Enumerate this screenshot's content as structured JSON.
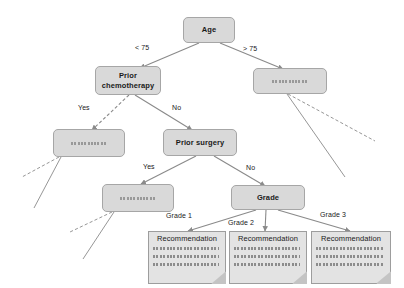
{
  "diagram": {
    "type": "decision-tree-flowchart",
    "colors": {
      "node_fill": "#d9d9d9",
      "node_border": "#a6a6a6",
      "doc_fill": "#e3e3e3",
      "doc_border": "#9d9d9d",
      "edge": "#808080",
      "text": "#1a1a1a",
      "background": "#ffffff"
    },
    "nodes": [
      {
        "id": "age",
        "label": "Age",
        "kind": "decision"
      },
      {
        "id": "prior_chemo",
        "label": "Prior\nchemotherapy",
        "line1": "Prior",
        "line2": "chemotherapy",
        "kind": "decision"
      },
      {
        "id": "age_over75_result",
        "label": "",
        "kind": "placeholder"
      },
      {
        "id": "chemo_yes_result",
        "label": "",
        "kind": "placeholder"
      },
      {
        "id": "prior_surgery",
        "label": "Prior surgery",
        "kind": "decision"
      },
      {
        "id": "surgery_yes_result",
        "label": "",
        "kind": "placeholder"
      },
      {
        "id": "grade",
        "label": "Grade",
        "kind": "decision"
      }
    ],
    "edge_labels": {
      "age_lt75": "< 75",
      "age_gt75": "> 75",
      "chemo_yes": "Yes",
      "chemo_no": "No",
      "surgery_yes": "Yes",
      "surgery_no": "No",
      "grade_1": "Grade 1",
      "grade_2": "Grade 2",
      "grade_3": "Grade 3"
    },
    "recommendations": [
      {
        "id": "rec_grade1",
        "title": "Recommendation"
      },
      {
        "id": "rec_grade2",
        "title": "Recommendation"
      },
      {
        "id": "rec_grade3",
        "title": "Recommendation"
      }
    ]
  }
}
